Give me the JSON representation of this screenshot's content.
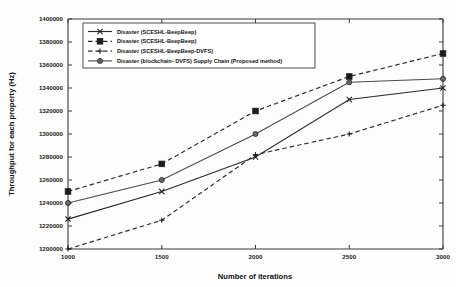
{
  "chart_data": {
    "type": "line",
    "title": "",
    "xlabel": "Number of iterations",
    "ylabel": "Throughput for each property (Hz)",
    "x": [
      1000,
      1500,
      2000,
      2500,
      3000
    ],
    "xtick_labels": [
      "1000",
      "1500",
      "2000",
      "2500",
      "3000"
    ],
    "xlim": [
      1000,
      3000
    ],
    "ylim": [
      1200000,
      1400000
    ],
    "ytick_labels": [
      "1200000",
      "1220000",
      "1240000",
      "1260000",
      "1280000",
      "1300000",
      "1320000",
      "1340000",
      "1360000",
      "1380000",
      "1400000"
    ],
    "yticks": [
      1200000,
      1220000,
      1240000,
      1260000,
      1280000,
      1300000,
      1320000,
      1340000,
      1360000,
      1380000,
      1400000
    ],
    "grid": false,
    "legend_position": "upper-left",
    "series": [
      {
        "name": "Disaster (SCESHL-BeepBeep)",
        "marker": "x",
        "linestyle": "solid",
        "values": [
          1226000,
          1250000,
          1280000,
          1330000,
          1340000
        ]
      },
      {
        "name": "Disaster (SCESHL-BeepBeep)",
        "marker": "square",
        "linestyle": "dashed",
        "values": [
          1250000,
          1274000,
          1320000,
          1350000,
          1370000
        ]
      },
      {
        "name": "Disaster (SCESHL-BeepBeep-DVFS)",
        "marker": "plus",
        "linestyle": "dashed",
        "values": [
          1200000,
          1225000,
          1282000,
          1300000,
          1325000
        ]
      },
      {
        "name": "Disaster (blockchain- DVFS) Supply Chain (Proposed method)",
        "marker": "circle",
        "linestyle": "solid",
        "values": [
          1240000,
          1260000,
          1300000,
          1345000,
          1348000
        ]
      }
    ]
  },
  "legend": {
    "entries": [
      "Disaster (SCESHL-BeepBeep)",
      "Disaster (SCESHL-BeepBeep)",
      "Disaster (SCESHL-BeepBeep-DVFS)",
      "Disaster (blockchain- DVFS) Supply Chain (Proposed method)"
    ]
  },
  "colors": {
    "axis": "#3a3a3a",
    "series_dark": "#2b2b2b",
    "series_grey": "#4a4a4a",
    "background": "#fdfdfd"
  }
}
